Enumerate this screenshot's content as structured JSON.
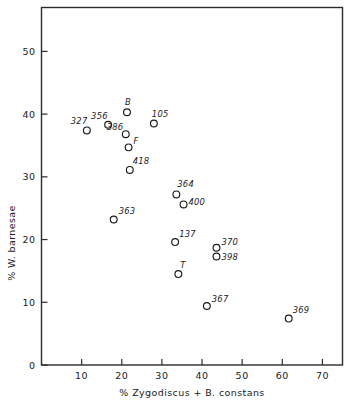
{
  "chart_data": {
    "type": "scatter",
    "title": "",
    "xlabel": "% Zygodiscus + B. constans",
    "ylabel": "% W. barnesae",
    "xlim": [
      0,
      75
    ],
    "ylim": [
      0,
      57
    ],
    "grid": false,
    "legend": "none",
    "xticks": [
      10,
      20,
      30,
      40,
      50,
      60,
      70
    ],
    "xtick_labels": [
      "10",
      "20",
      "30",
      "40",
      "50",
      "60",
      "70"
    ],
    "yticks": [
      0,
      10,
      20,
      30,
      40,
      50
    ],
    "ytick_labels": [
      "0",
      "10",
      "20",
      "30",
      "40",
      "50"
    ],
    "marker": "open-circle",
    "points": [
      {
        "label": "327",
        "x": 11.3,
        "y": 37.4,
        "lx": -16,
        "ly": -6
      },
      {
        "label": "356",
        "x": 16.6,
        "y": 38.3,
        "lx": -17,
        "ly": -6
      },
      {
        "label": "B",
        "x": 21.3,
        "y": 40.3,
        "lx": -2,
        "ly": -7
      },
      {
        "label": "386",
        "x": 21.0,
        "y": 36.8,
        "lx": -19,
        "ly": -4
      },
      {
        "label": "F",
        "x": 21.7,
        "y": 34.7,
        "lx": 5,
        "ly": -3
      },
      {
        "label": "418",
        "x": 22.0,
        "y": 31.1,
        "lx": 3,
        "ly": -6
      },
      {
        "label": "105",
        "x": 28.0,
        "y": 38.5,
        "lx": -2,
        "ly": -7
      },
      {
        "label": "363",
        "x": 18.0,
        "y": 23.2,
        "lx": 5,
        "ly": -5
      },
      {
        "label": "364",
        "x": 33.6,
        "y": 27.2,
        "lx": 1,
        "ly": -7
      },
      {
        "label": "400",
        "x": 35.4,
        "y": 25.6,
        "lx": 5,
        "ly": 1
      },
      {
        "label": "137",
        "x": 33.3,
        "y": 19.6,
        "lx": 4,
        "ly": -5
      },
      {
        "label": "T",
        "x": 34.1,
        "y": 14.5,
        "lx": 2,
        "ly": -6
      },
      {
        "label": "370",
        "x": 43.6,
        "y": 18.7,
        "lx": 5,
        "ly": -3
      },
      {
        "label": "398",
        "x": 43.6,
        "y": 17.3,
        "lx": 5,
        "ly": 4
      },
      {
        "label": "367",
        "x": 41.2,
        "y": 9.4,
        "lx": 5,
        "ly": -4
      },
      {
        "label": "369",
        "x": 61.6,
        "y": 7.4,
        "lx": 4,
        "ly": -6
      }
    ]
  }
}
